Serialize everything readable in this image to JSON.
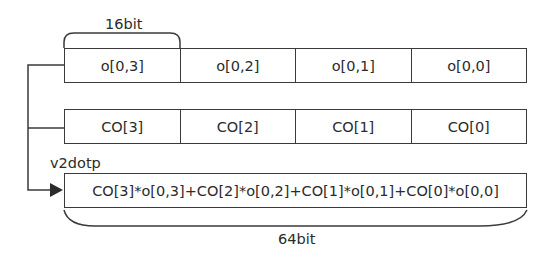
{
  "diagram": {
    "top_brace_label": "16bit",
    "bottom_brace_label": "64bit",
    "op_label": "v2dotp",
    "row_o": [
      "o[0,3]",
      "o[0,2]",
      "o[0,1]",
      "o[0,0]"
    ],
    "row_co": [
      "CO[3]",
      "CO[2]",
      "CO[1]",
      "CO[0]"
    ],
    "result": "CO[3]*o[0,3]+CO[2]*o[0,2]+CO[1]*o[0,1]+CO[0]*o[0,0]",
    "colors": {
      "line": "#3a3a3a",
      "text": "#2b2b2b",
      "background": "#ffffff"
    }
  }
}
